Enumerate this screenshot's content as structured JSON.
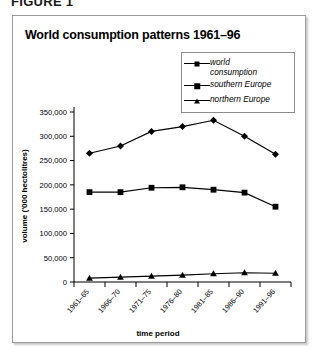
{
  "figure": {
    "caption": "FIGURE 1"
  },
  "chart": {
    "title": "World consumption patterns 1961–96",
    "xlabel": "time period",
    "ylabel": "volume ('000 hectolitres)"
  },
  "legend": {
    "items": [
      {
        "label": "world\nconsumption",
        "marker": "diamond-marker"
      },
      {
        "label": "southern Europe",
        "marker": "square-marker"
      },
      {
        "label": "northern Europe",
        "marker": "triangle-marker"
      }
    ]
  },
  "axis": {
    "y_ticks": [
      "0",
      "50,000",
      "100,000",
      "150,000",
      "200,000",
      "250,000",
      "300,000",
      "350,000"
    ],
    "x_ticks": [
      "1961–65",
      "1966–70",
      "1971–75",
      "1976–80",
      "1981–85",
      "1986–90",
      "1991–96"
    ]
  },
  "chart_data": {
    "type": "line",
    "title": "World consumption patterns 1961–96",
    "xlabel": "time period",
    "ylabel": "volume ('000 hectolitres)",
    "categories": [
      "1961–65",
      "1966–70",
      "1971–75",
      "1976–80",
      "1981–85",
      "1986–90",
      "1991–96"
    ],
    "series": [
      {
        "name": "world consumption",
        "marker": "diamond",
        "values": [
          265000,
          280000,
          310000,
          320000,
          333000,
          300000,
          263000
        ]
      },
      {
        "name": "southern Europe",
        "marker": "square",
        "values": [
          185000,
          185000,
          194000,
          195000,
          190000,
          184000,
          155000
        ]
      },
      {
        "name": "northern Europe",
        "marker": "triangle",
        "values": [
          8000,
          10000,
          12000,
          14000,
          17000,
          19000,
          18000
        ]
      }
    ],
    "ylim": [
      0,
      350000
    ],
    "ytick_step": 50000,
    "grid": false,
    "legend_position": "top-right"
  }
}
